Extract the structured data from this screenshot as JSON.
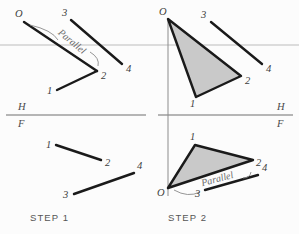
{
  "figure": {
    "background_color": "#fcfcfc",
    "colors": {
      "line_dark": "#1a1a1a",
      "line_thin": "#3a3a3a",
      "triangle_fill": "#c9c9c9",
      "triangle_stroke": "#1a1a1a",
      "reference_line": "#6f6f6f",
      "light_guide": "#d8d8d8",
      "label_text": "#3d3d3d",
      "step_text": "#555555",
      "parallel_text": "#6a6a6a"
    }
  },
  "panels": [
    {
      "id": "step-1",
      "caption": "STEP 1",
      "caption_position": {
        "x": 30,
        "y": 221
      },
      "views": {
        "top": {
          "name": "horizontal-view",
          "points": [
            {
              "id": "O",
              "label": "O",
              "x": 24,
              "y": 22,
              "label_x": 15,
              "label_y": 17
            },
            {
              "id": "1",
              "label": "1",
              "x": 57,
              "y": 90,
              "label_x": 47,
              "label_y": 94
            },
            {
              "id": "2",
              "label": "2",
              "x": 97,
              "y": 71,
              "label_x": 101,
              "label_y": 79
            },
            {
              "id": "3",
              "label": "3",
              "x": 71,
              "y": 20,
              "label_x": 62,
              "label_y": 16
            },
            {
              "id": "4",
              "label": "4",
              "x": 122,
              "y": 64,
              "label_x": 126,
              "label_y": 72
            }
          ],
          "segments": [
            {
              "name": "segment-O-2",
              "from": "O",
              "to": "2",
              "width": 2.4
            },
            {
              "name": "segment-1-2",
              "from": "1",
              "to": "2",
              "width": 2.4
            },
            {
              "name": "segment-3-4",
              "from": "3",
              "to": "4",
              "width": 2.4
            }
          ],
          "annotation": {
            "text": "Parallel",
            "x": 70,
            "y": 44,
            "rotation": 40
          }
        },
        "front": {
          "name": "frontal-view",
          "points": [
            {
              "id": "1",
              "label": "1",
              "x": 56,
              "y": 145,
              "label_x": 46,
              "label_y": 148
            },
            {
              "id": "2",
              "label": "2",
              "x": 101,
              "y": 160,
              "label_x": 105,
              "label_y": 166
            },
            {
              "id": "3",
              "label": "3",
              "x": 74,
              "y": 194,
              "label_x": 63,
              "label_y": 198
            },
            {
              "id": "4",
              "label": "4",
              "x": 134,
              "y": 173,
              "label_x": 137,
              "label_y": 169
            }
          ],
          "segments": [
            {
              "name": "segment-1-2",
              "from": "1",
              "to": "2",
              "width": 2.4
            },
            {
              "name": "segment-3-4",
              "from": "3",
              "to": "4",
              "width": 2.4
            }
          ]
        }
      },
      "reference": {
        "name": "hf-reference-line",
        "x1": 6,
        "x2": 146,
        "y": 115,
        "h_label": "H",
        "h_x": 18,
        "h_y": 110,
        "f_label": "F",
        "f_x": 18,
        "f_y": 126
      }
    },
    {
      "id": "step-2",
      "caption": "STEP 2",
      "caption_position": {
        "x": 168,
        "y": 221
      },
      "views": {
        "top": {
          "name": "horizontal-view",
          "points": [
            {
              "id": "O",
              "label": "O",
              "x": 168,
              "y": 19,
              "label_x": 159,
              "label_y": 15
            },
            {
              "id": "1",
              "label": "1",
              "x": 196,
              "y": 97,
              "label_x": 190,
              "label_y": 107
            },
            {
              "id": "2",
              "label": "2",
              "x": 241,
              "y": 76,
              "label_x": 245,
              "label_y": 84
            },
            {
              "id": "3",
              "label": "3",
              "x": 211,
              "y": 22,
              "label_x": 201,
              "label_y": 18
            },
            {
              "id": "4",
              "label": "4",
              "x": 262,
              "y": 64,
              "label_x": 266,
              "label_y": 72
            }
          ],
          "triangle": {
            "name": "shaded-triangle-top",
            "vertices": [
              "O",
              "1",
              "2"
            ]
          },
          "segments": [
            {
              "name": "segment-3-4",
              "from": "3",
              "to": "4",
              "width": 2.4
            }
          ]
        },
        "front": {
          "name": "frontal-view",
          "points": [
            {
              "id": "O",
              "label": "O",
              "x": 168,
              "y": 188,
              "label_x": 158,
              "label_y": 195
            },
            {
              "id": "1",
              "label": "1",
              "x": 195,
              "y": 145,
              "label_x": 190,
              "label_y": 140
            },
            {
              "id": "2",
              "label": "2",
              "x": 253,
              "y": 160,
              "label_x": 256,
              "label_y": 166
            },
            {
              "id": "3",
              "label": "3",
              "x": 205,
              "y": 190,
              "label_x": 195,
              "label_y": 196
            },
            {
              "id": "4",
              "label": "4",
              "x": 258,
              "y": 175,
              "label_x": 262,
              "label_y": 171
            }
          ],
          "triangle": {
            "name": "shaded-triangle-front",
            "vertices": [
              "O",
              "1",
              "2"
            ]
          },
          "segments": [
            {
              "name": "segment-3-4",
              "from": "3",
              "to": "4",
              "width": 2.4
            }
          ],
          "annotation": {
            "text": "Parallel",
            "x": 218,
            "y": 182,
            "rotation": -15
          }
        }
      },
      "reference": {
        "name": "hf-reference-line",
        "x1": 158,
        "x2": 293,
        "y": 115,
        "h_label": "H",
        "h_x": 277,
        "h_y": 110,
        "f_label": "F",
        "f_x": 277,
        "f_y": 126
      },
      "vertical_axis": {
        "name": "folding-axis",
        "x": 168,
        "y1": 19,
        "y2": 196
      }
    }
  ],
  "guides": [
    {
      "name": "light-horizontal-guide",
      "x1": 0,
      "x2": 299,
      "y": 45
    }
  ]
}
